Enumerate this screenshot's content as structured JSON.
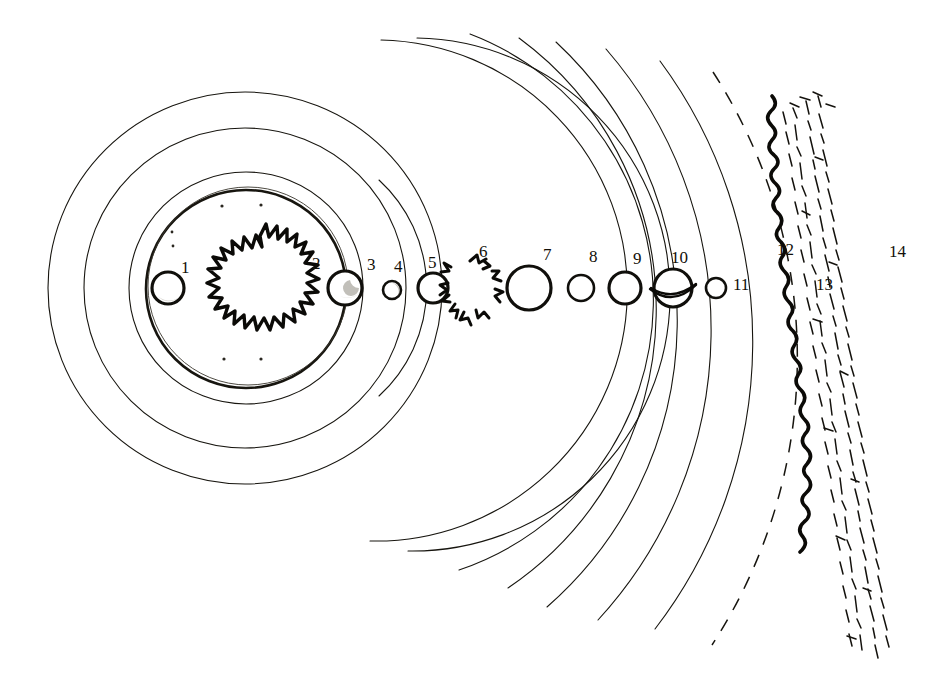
{
  "figure": {
    "background_color": "#ffffff",
    "ink_color": "#17150f",
    "width": 938,
    "height": 686,
    "center": {
      "x": 245,
      "y": 288
    }
  },
  "labels": [
    {
      "id": "1",
      "text": "1",
      "x": 181,
      "y": 259,
      "refers_to": "inner-planet-left"
    },
    {
      "id": "2",
      "text": "2",
      "x": 312,
      "y": 255,
      "refers_to": "sun"
    },
    {
      "id": "3",
      "text": "3",
      "x": 367,
      "y": 256,
      "refers_to": "planet-3"
    },
    {
      "id": "4",
      "text": "4",
      "x": 394,
      "y": 258,
      "refers_to": "planet-4"
    },
    {
      "id": "5",
      "text": "5",
      "x": 428,
      "y": 254,
      "refers_to": "planet-5"
    },
    {
      "id": "6",
      "text": "6",
      "x": 479,
      "y": 243,
      "refers_to": "asteroid-belt"
    },
    {
      "id": "7",
      "text": "7",
      "x": 543,
      "y": 246,
      "refers_to": "planet-7"
    },
    {
      "id": "8",
      "text": "8",
      "x": 589,
      "y": 248,
      "refers_to": "planet-8"
    },
    {
      "id": "9",
      "text": "9",
      "x": 633,
      "y": 250,
      "refers_to": "planet-9"
    },
    {
      "id": "10",
      "text": "10",
      "x": 671,
      "y": 249,
      "refers_to": "planet-10-ringed"
    },
    {
      "id": "11",
      "text": "11",
      "x": 733,
      "y": 276,
      "refers_to": "planet-11"
    },
    {
      "id": "12",
      "text": "12",
      "x": 777,
      "y": 241,
      "refers_to": "dashed-orbit"
    },
    {
      "id": "13",
      "text": "13",
      "x": 816,
      "y": 276,
      "refers_to": "wiggly-orbit"
    },
    {
      "id": "14",
      "text": "14",
      "x": 889,
      "y": 243,
      "refers_to": "scattered-belt"
    }
  ],
  "bodies": [
    {
      "name": "inner-planet-left",
      "index": "1",
      "cx": 168,
      "cy": 288,
      "r": 16,
      "style": "shaded-sphere"
    },
    {
      "name": "sun",
      "index": "2",
      "cx": 260,
      "cy": 283,
      "r": 47,
      "style": "flame-disc"
    },
    {
      "name": "planet-3",
      "index": "3",
      "cx": 345,
      "cy": 288,
      "r": 17,
      "style": "shaded-sphere"
    },
    {
      "name": "planet-4",
      "index": "4",
      "cx": 392,
      "cy": 290,
      "r": 9,
      "style": "small-circle"
    },
    {
      "name": "planet-5",
      "index": "5",
      "cx": 433,
      "cy": 288,
      "r": 15,
      "style": "plain-circle"
    },
    {
      "name": "asteroid-belt",
      "index": "6",
      "cx": 472,
      "cy": 286,
      "r": 24,
      "style": "fragment-ring"
    },
    {
      "name": "planet-7",
      "index": "7",
      "cx": 529,
      "cy": 288,
      "r": 22,
      "style": "plain-circle"
    },
    {
      "name": "planet-8",
      "index": "8",
      "cx": 581,
      "cy": 288,
      "r": 13,
      "style": "plain-circle"
    },
    {
      "name": "planet-9",
      "index": "9",
      "cx": 625,
      "cy": 288,
      "r": 16,
      "style": "plain-circle"
    },
    {
      "name": "planet-10-ringed",
      "index": "10",
      "cx": 673,
      "cy": 288,
      "r": 19,
      "style": "ringed-planet"
    },
    {
      "name": "planet-11",
      "index": "11",
      "cx": 716,
      "cy": 288,
      "r": 10,
      "style": "plain-circle"
    }
  ],
  "orbits": [
    {
      "name": "orbit-ring-1",
      "radius": 197,
      "kind": "full-circle",
      "weight": "thin"
    },
    {
      "name": "orbit-ring-2",
      "radius": 161,
      "kind": "full-circle",
      "weight": "thin"
    },
    {
      "name": "orbit-ring-3",
      "radius": 117,
      "kind": "full-circle",
      "weight": "thin"
    },
    {
      "name": "orbit-ring-4",
      "radius": 100,
      "kind": "full-circle",
      "weight": "bold"
    },
    {
      "name": "orbit-arc-5",
      "radius": 148,
      "kind": "arc",
      "weight": "thin"
    },
    {
      "name": "orbit-arc-6",
      "radius": 190,
      "kind": "arc",
      "weight": "thin"
    },
    {
      "name": "orbit-arc-7",
      "radius": 228,
      "kind": "arc",
      "weight": "thin"
    },
    {
      "name": "orbit-arc-8",
      "radius": 286,
      "kind": "arc",
      "weight": "thin"
    },
    {
      "name": "orbit-arc-9",
      "radius": 338,
      "kind": "arc",
      "weight": "thin"
    },
    {
      "name": "orbit-arc-10",
      "radius": 382,
      "kind": "arc",
      "weight": "thin"
    },
    {
      "name": "orbit-arc-11",
      "radius": 430,
      "kind": "arc",
      "weight": "thin"
    },
    {
      "name": "orbit-arc-12",
      "radius": 473,
      "kind": "arc",
      "weight": "thin"
    },
    {
      "name": "orbit-dashed-13",
      "radius": 528,
      "kind": "dashed-arc",
      "weight": "thin"
    },
    {
      "name": "orbit-wiggle-14",
      "radius": 558,
      "kind": "wiggly-arc",
      "weight": "bold"
    },
    {
      "name": "scattered-belt-15",
      "radius": 620,
      "kind": "dash-band",
      "weight": "thin"
    }
  ],
  "legend_note": "Numbered features 1 through 14 arranged outward from the central star"
}
